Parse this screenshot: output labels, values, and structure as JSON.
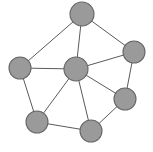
{
  "figure": {
    "width": 153,
    "height": 152,
    "background_color": "#ffffff"
  },
  "style": {
    "node_fill": "#9a9a9a",
    "node_stroke": "#666666",
    "node_stroke_width": 1.1,
    "edge_color": "#5a5a5a",
    "edge_width": 1
  },
  "chart_data": {
    "type": "diagram",
    "diagram_kind": "node-link graph",
    "title": "",
    "node_count": 7,
    "edge_count": 12,
    "nodes": [
      {
        "id": "n1",
        "label": "",
        "x": 82,
        "y": 14,
        "r": 12,
        "position_name": "top"
      },
      {
        "id": "n2",
        "label": "",
        "x": 20,
        "y": 68,
        "r": 11,
        "position_name": "left"
      },
      {
        "id": "n3",
        "label": "",
        "x": 76,
        "y": 69,
        "r": 12,
        "position_name": "center"
      },
      {
        "id": "n4",
        "label": "",
        "x": 134,
        "y": 52,
        "r": 11,
        "position_name": "right"
      },
      {
        "id": "n5",
        "label": "",
        "x": 125,
        "y": 99,
        "r": 11,
        "position_name": "bottom-right"
      },
      {
        "id": "n6",
        "label": "",
        "x": 91,
        "y": 131,
        "r": 11,
        "position_name": "bottom-center"
      },
      {
        "id": "n7",
        "label": "",
        "x": 37,
        "y": 122,
        "r": 11,
        "position_name": "bottom-left"
      }
    ],
    "edges": [
      {
        "from": "n1",
        "to": "n2"
      },
      {
        "from": "n1",
        "to": "n3"
      },
      {
        "from": "n1",
        "to": "n4"
      },
      {
        "from": "n2",
        "to": "n3"
      },
      {
        "from": "n2",
        "to": "n7"
      },
      {
        "from": "n3",
        "to": "n4"
      },
      {
        "from": "n3",
        "to": "n5"
      },
      {
        "from": "n3",
        "to": "n6"
      },
      {
        "from": "n3",
        "to": "n7"
      },
      {
        "from": "n4",
        "to": "n5"
      },
      {
        "from": "n5",
        "to": "n6"
      },
      {
        "from": "n6",
        "to": "n7"
      }
    ],
    "degrees": {
      "n1": 3,
      "n2": 3,
      "n3": 6,
      "n4": 3,
      "n5": 3,
      "n6": 3,
      "n7": 3
    }
  }
}
